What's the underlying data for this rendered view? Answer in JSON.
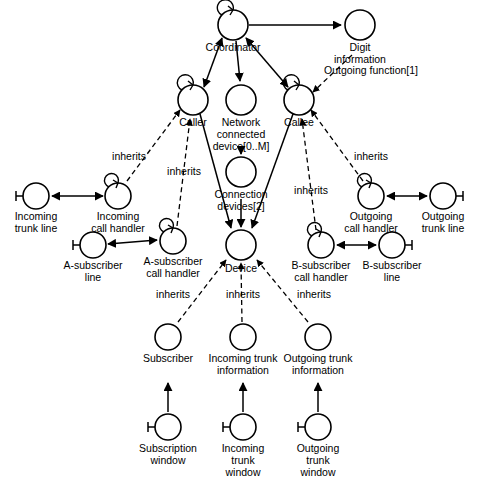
{
  "diagram": {
    "type": "object-communication-diagram",
    "background_color": "#ffffff",
    "line_color": "#000000",
    "nodes": [
      {
        "id": "coordinator",
        "label_lines": [
          "Coordinator"
        ],
        "cx": 233,
        "cy": 25,
        "r": 15,
        "self_loop": true,
        "port_stub": false
      },
      {
        "id": "digit_info",
        "label_lines": [
          "Digit",
          "information"
        ],
        "cx": 360,
        "cy": 25,
        "r": 15,
        "self_loop": false,
        "port_stub": false
      },
      {
        "id": "caller",
        "label_lines": [
          "Caller"
        ],
        "cx": 193,
        "cy": 100,
        "r": 15,
        "self_loop": true,
        "port_stub": false
      },
      {
        "id": "network_device",
        "label_lines": [
          "Network",
          "connected",
          "device[0..M]"
        ],
        "cx": 241,
        "cy": 100,
        "r": 15,
        "self_loop": false,
        "port_stub": false
      },
      {
        "id": "callee",
        "label_lines": [
          "Callee"
        ],
        "cx": 299,
        "cy": 100,
        "r": 15,
        "self_loop": true,
        "port_stub": false
      },
      {
        "id": "connection_dev",
        "label_lines": [
          "Connection",
          "devices[2]"
        ],
        "cx": 241,
        "cy": 172,
        "r": 15,
        "self_loop": false,
        "port_stub": false
      },
      {
        "id": "incoming_trunk_line",
        "label_lines": [
          "Incoming",
          "trunk line"
        ],
        "cx": 36,
        "cy": 196,
        "r": 13,
        "self_loop": false,
        "port_stub": true
      },
      {
        "id": "incoming_call_handler",
        "label_lines": [
          "Incoming",
          "call handler"
        ],
        "cx": 118,
        "cy": 196,
        "r": 13,
        "self_loop": true,
        "port_stub": false
      },
      {
        "id": "a_sub_line",
        "label_lines": [
          "A-subscriber",
          "line"
        ],
        "cx": 93,
        "cy": 245,
        "r": 13,
        "self_loop": false,
        "port_stub": true
      },
      {
        "id": "a_sub_handler",
        "label_lines": [
          "A-subscriber",
          "call handler"
        ],
        "cx": 173,
        "cy": 241,
        "r": 13,
        "self_loop": true,
        "port_stub": false
      },
      {
        "id": "outgoing_call_handler",
        "label_lines": [
          "Outgoing",
          "call handler"
        ],
        "cx": 371,
        "cy": 196,
        "r": 13,
        "self_loop": true,
        "port_stub": false
      },
      {
        "id": "outgoing_trunk_line",
        "label_lines": [
          "Outgoing",
          "trunk line"
        ],
        "cx": 443,
        "cy": 196,
        "r": 13,
        "self_loop": false,
        "port_stub": true
      },
      {
        "id": "b_sub_handler",
        "label_lines": [
          "B-subscriber",
          "call handler"
        ],
        "cx": 321,
        "cy": 245,
        "r": 13,
        "self_loop": true,
        "port_stub": false
      },
      {
        "id": "b_sub_line",
        "label_lines": [
          "B-subscriber",
          "line"
        ],
        "cx": 392,
        "cy": 245,
        "r": 13,
        "self_loop": false,
        "port_stub": true
      },
      {
        "id": "device",
        "label_lines": [
          "Device"
        ],
        "cx": 241,
        "cy": 245,
        "r": 15,
        "self_loop": false,
        "port_stub": false
      },
      {
        "id": "subscriber",
        "label_lines": [
          "Subscriber"
        ],
        "cx": 168,
        "cy": 337,
        "r": 13,
        "self_loop": false,
        "port_stub": false
      },
      {
        "id": "incoming_trunk_info",
        "label_lines": [
          "Incoming trunk",
          "information"
        ],
        "cx": 243,
        "cy": 337,
        "r": 13,
        "self_loop": false,
        "port_stub": false
      },
      {
        "id": "outgoing_trunk_info",
        "label_lines": [
          "Outgoing trunk",
          "information"
        ],
        "cx": 318,
        "cy": 337,
        "r": 13,
        "self_loop": false,
        "port_stub": false
      },
      {
        "id": "subscription_window",
        "label_lines": [
          "Subscription",
          "window"
        ],
        "cx": 168,
        "cy": 427,
        "r": 13,
        "self_loop": false,
        "port_stub": true
      },
      {
        "id": "incoming_trunk_window",
        "label_lines": [
          "Incoming",
          "trunk",
          "window"
        ],
        "cx": 243,
        "cy": 427,
        "r": 13,
        "self_loop": false,
        "port_stub": true
      },
      {
        "id": "outgoing_trunk_window",
        "label_lines": [
          "Outgoing",
          "trunk",
          "window"
        ],
        "cx": 318,
        "cy": 427,
        "r": 13,
        "self_loop": false,
        "port_stub": true
      }
    ],
    "edge_labels": [
      {
        "id": "outgoing_function",
        "text": "Outgoing function[1]",
        "x": 371,
        "y": 71
      },
      {
        "id": "inherits_caller_left",
        "text": "inherits",
        "x": 129,
        "y": 157
      },
      {
        "id": "inherits_caller_right",
        "text": "inherits",
        "x": 184,
        "y": 172
      },
      {
        "id": "inherits_callee_left",
        "text": "inherits",
        "x": 311,
        "y": 191
      },
      {
        "id": "inherits_callee_right",
        "text": "inherits",
        "x": 371,
        "y": 157
      },
      {
        "id": "inherits_device_left",
        "text": "inherits",
        "x": 173,
        "y": 295
      },
      {
        "id": "inherits_device_mid",
        "text": "inherits",
        "x": 243,
        "y": 295
      },
      {
        "id": "inherits_device_right",
        "text": "inherits",
        "x": 314,
        "y": 295
      }
    ],
    "edges": [
      {
        "from": "coordinator",
        "to": "digit_info",
        "style": "solid",
        "arrows": "end"
      },
      {
        "from": "coordinator",
        "to": "caller",
        "style": "solid",
        "arrows": "both"
      },
      {
        "from": "coordinator",
        "to": "network_device",
        "style": "solid",
        "arrows": "end"
      },
      {
        "from": "coordinator",
        "to": "callee",
        "style": "solid",
        "arrows": "both"
      },
      {
        "from": "digit_info",
        "to": "callee",
        "style": "dashed",
        "arrows": "end",
        "label": "Outgoing function[1]"
      },
      {
        "from": "network_device",
        "to": "connection_dev",
        "style": "solid",
        "arrows": "end"
      },
      {
        "from": "caller",
        "to": "device",
        "style": "solid",
        "arrows": "end"
      },
      {
        "from": "connection_dev",
        "to": "device",
        "style": "solid",
        "arrows": "end"
      },
      {
        "from": "callee",
        "to": "device",
        "style": "solid",
        "arrows": "end"
      },
      {
        "from": "incoming_call_handler",
        "to": "caller",
        "style": "dashed",
        "arrows": "end",
        "label": "inherits"
      },
      {
        "from": "a_sub_handler",
        "to": "caller",
        "style": "dashed",
        "arrows": "end",
        "label": "inherits"
      },
      {
        "from": "outgoing_call_handler",
        "to": "callee",
        "style": "dashed",
        "arrows": "end",
        "label": "inherits"
      },
      {
        "from": "b_sub_handler",
        "to": "callee",
        "style": "dashed",
        "arrows": "end",
        "label": "inherits"
      },
      {
        "from": "incoming_trunk_line",
        "to": "incoming_call_handler",
        "style": "solid",
        "arrows": "both"
      },
      {
        "from": "a_sub_line",
        "to": "a_sub_handler",
        "style": "solid",
        "arrows": "both"
      },
      {
        "from": "outgoing_call_handler",
        "to": "outgoing_trunk_line",
        "style": "solid",
        "arrows": "both"
      },
      {
        "from": "b_sub_handler",
        "to": "b_sub_line",
        "style": "solid",
        "arrows": "both"
      },
      {
        "from": "subscriber",
        "to": "device",
        "style": "dashed",
        "arrows": "end",
        "label": "inherits"
      },
      {
        "from": "incoming_trunk_info",
        "to": "device",
        "style": "dashed",
        "arrows": "end",
        "label": "inherits"
      },
      {
        "from": "outgoing_trunk_info",
        "to": "device",
        "style": "dashed",
        "arrows": "end",
        "label": "inherits"
      },
      {
        "from": "subscription_window",
        "to": "subscriber",
        "style": "solid",
        "arrows": "end"
      },
      {
        "from": "incoming_trunk_window",
        "to": "incoming_trunk_info",
        "style": "solid",
        "arrows": "end"
      },
      {
        "from": "outgoing_trunk_window",
        "to": "outgoing_trunk_info",
        "style": "solid",
        "arrows": "end"
      }
    ]
  }
}
